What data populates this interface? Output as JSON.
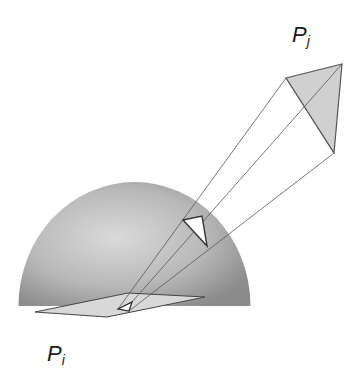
{
  "diagram": {
    "labels": {
      "pj": {
        "base": "P",
        "sub": "j"
      },
      "pi": {
        "base": "P",
        "sub": "i"
      }
    },
    "colors": {
      "hemisphere_light": "#d8d8d8",
      "hemisphere_dark": "#8a8a8a",
      "patch_fill": "#d4d4d4",
      "line": "#555555",
      "projection_fill": "#ffffff"
    },
    "shapes": {
      "hemisphere": {
        "cx": 134.5,
        "base_y": 306,
        "radius": 116
      },
      "pj_triangle": [
        [
          286,
          78
        ],
        [
          342,
          64
        ],
        [
          334,
          153
        ]
      ],
      "hemisphere_projection": [
        [
          183,
          220
        ],
        [
          202,
          216
        ],
        [
          207,
          246
        ]
      ],
      "pi_patch": [
        [
          35,
          312
        ],
        [
          128,
          293
        ],
        [
          205,
          297
        ],
        [
          107,
          317
        ]
      ],
      "pi_projection": [
        [
          118,
          309
        ],
        [
          132,
          302
        ],
        [
          129,
          311
        ]
      ]
    }
  }
}
